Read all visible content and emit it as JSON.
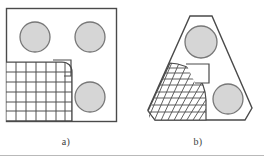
{
  "figure": {
    "title": "",
    "background_color": "#ffffff",
    "width": 264,
    "height": 157,
    "bottom_rule": {
      "visible": true,
      "color": "#b9b9b9",
      "y": 155
    }
  },
  "styles": {
    "outline_color": "#5a5a5a",
    "outline_color_dark": "#4a4a4a",
    "hole_fill": "#d6d6d6",
    "hole_stroke": "#777777",
    "mesh_line_color": "#4f4f4f",
    "mesh_line_color_light": "#6e6e6e",
    "caption_color": "#3d3d3d"
  },
  "panels": [
    {
      "id": "a",
      "caption": "a)",
      "part_shape": "square-plate",
      "part_outline": {
        "type": "rect",
        "x": 6,
        "y": 8,
        "width": 110,
        "height": 113
      },
      "holes": [
        {
          "name": "hole-top-left",
          "cx": 35,
          "cy": 37,
          "r": 15
        },
        {
          "name": "hole-top-right",
          "cx": 90,
          "cy": 37,
          "r": 15
        },
        {
          "name": "hole-bottom-right",
          "cx": 90,
          "cy": 97,
          "r": 15
        }
      ],
      "mesh": {
        "name": "structured-quad-mesh",
        "kind": "structured-quadrilateral",
        "columns": 7,
        "rows": 6,
        "region_x": 6,
        "region_y": 62,
        "region_width": 69,
        "region_height": 59,
        "notch": {
          "visible": true,
          "x": 52,
          "y": 60,
          "width": 19,
          "height": 16
        }
      }
    },
    {
      "id": "b",
      "caption": "b)",
      "part_shape": "truncated-triangle-plate",
      "part_outline": {
        "type": "polygon",
        "points": "199,16 219,16 252,110 252,120 159,120 149,120 180,26"
      },
      "holes": [
        {
          "name": "hole-top",
          "cx": 201,
          "cy": 42,
          "r": 16
        },
        {
          "name": "hole-bottom-right",
          "cx": 228,
          "cy": 99,
          "r": 15
        }
      ],
      "mesh": {
        "name": "mapped-curved-mesh",
        "kind": "mapped-curvilinear",
        "radial_lines": 9,
        "circumferential_lines": 9,
        "region_x": 149,
        "region_y": 63,
        "region_width": 72,
        "region_height": 57,
        "notch": {
          "visible": true,
          "x": 186,
          "y": 63,
          "width": 23,
          "height": 18
        }
      }
    }
  ]
}
